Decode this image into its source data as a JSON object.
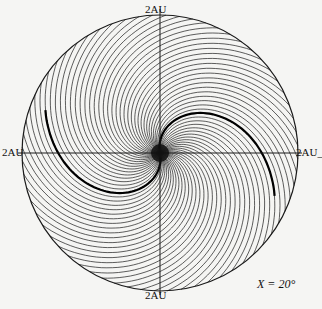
{
  "figure": {
    "labels": {
      "top": "2AU",
      "bottom": "2AU",
      "left": "2AU",
      "right": "2AU_"
    },
    "annotation": "X = 20°",
    "colors": {
      "line": "#1a1a1a",
      "background": "#f5f5f3"
    }
  },
  "diagram": {
    "type": "spiral-field-lines",
    "center": [
      160,
      153
    ],
    "radius": 138,
    "num_lines": 64,
    "twist": 2.4,
    "current_sheet_arcs": 2
  }
}
